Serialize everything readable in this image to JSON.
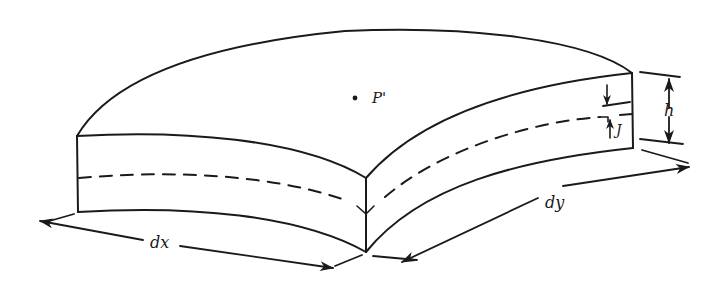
{
  "figure": {
    "labels": {
      "point": "P'",
      "thickness": "h",
      "offset": "J",
      "width_x": "dx",
      "width_y": "dy"
    },
    "stroke_color": "#1a1a1a",
    "background": "#ffffff"
  }
}
